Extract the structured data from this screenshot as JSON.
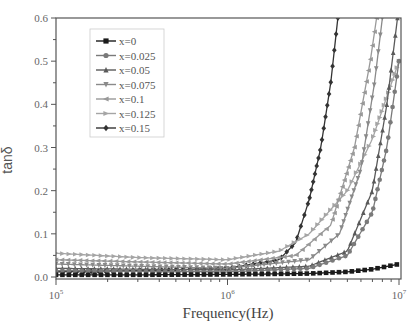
{
  "chart_data": {
    "type": "line",
    "title": "",
    "xlabel": "Frequency(Hz)",
    "ylabel": "tanδ",
    "xscale": "log",
    "xlim": [
      100000,
      10000000
    ],
    "ylim": [
      0.0,
      0.6
    ],
    "x_ticks": [
      "10^5",
      "10^6",
      "10^7"
    ],
    "y_ticks": [
      "0.0",
      "0.1",
      "0.2",
      "0.3",
      "0.4",
      "0.5",
      "0.6"
    ],
    "grid": false,
    "legend_position": "upper-left",
    "series": [
      {
        "name": "x=0",
        "marker": "square",
        "color": "#1a1a1a",
        "x": [
          100000,
          300000,
          1000000,
          3000000,
          5000000,
          7000000,
          10000000
        ],
        "y": [
          0.005,
          0.005,
          0.006,
          0.008,
          0.012,
          0.018,
          0.03
        ]
      },
      {
        "name": "x=0.025",
        "marker": "circle",
        "color": "#7a7a7a",
        "x": [
          100000,
          300000,
          1000000,
          3000000,
          5000000,
          7000000,
          8500000,
          10000000
        ],
        "y": [
          0.015,
          0.013,
          0.012,
          0.02,
          0.05,
          0.15,
          0.3,
          0.5
        ]
      },
      {
        "name": "x=0.05",
        "marker": "triangle-up",
        "color": "#5a5a5a",
        "x": [
          100000,
          300000,
          1000000,
          3000000,
          5000000,
          7000000,
          8500000,
          9800000
        ],
        "y": [
          0.02,
          0.018,
          0.016,
          0.025,
          0.06,
          0.2,
          0.4,
          0.6
        ]
      },
      {
        "name": "x=0.075",
        "marker": "triangle-down",
        "color": "#8a8a8a",
        "x": [
          100000,
          300000,
          1000000,
          3000000,
          4500000,
          6000000,
          7200000,
          8000000
        ],
        "y": [
          0.03,
          0.025,
          0.02,
          0.04,
          0.1,
          0.25,
          0.45,
          0.6
        ]
      },
      {
        "name": "x=0.1",
        "marker": "triangle-left",
        "color": "#999999",
        "x": [
          100000,
          300000,
          1000000,
          2500000,
          4000000,
          5500000,
          6800000,
          7400000
        ],
        "y": [
          0.04,
          0.035,
          0.03,
          0.05,
          0.12,
          0.3,
          0.5,
          0.6
        ]
      },
      {
        "name": "x=0.125",
        "marker": "triangle-right",
        "color": "#a5a5a5",
        "x": [
          100000,
          300000,
          1000000,
          2000000,
          3000000,
          5000000,
          7000000,
          10000000
        ],
        "y": [
          0.055,
          0.045,
          0.04,
          0.06,
          0.1,
          0.2,
          0.32,
          0.5
        ]
      },
      {
        "name": "x=0.15",
        "marker": "diamond",
        "color": "#333333",
        "x": [
          100000,
          300000,
          1000000,
          2000000,
          2500000,
          3000000,
          3500000,
          4000000,
          4400000
        ],
        "y": [
          0.012,
          0.015,
          0.02,
          0.04,
          0.08,
          0.18,
          0.3,
          0.45,
          0.6
        ]
      }
    ]
  }
}
